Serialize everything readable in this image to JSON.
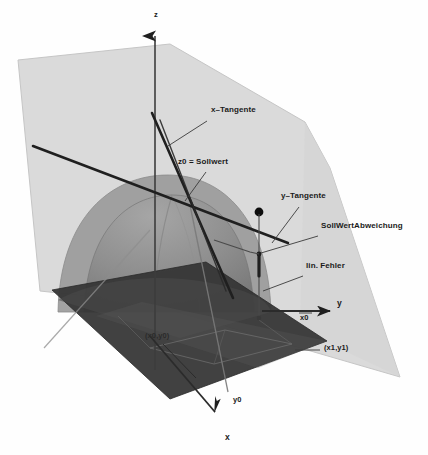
{
  "axes": {
    "z": {
      "label": "z",
      "x": 154,
      "y": 13
    },
    "y": {
      "label": "y",
      "x": 337,
      "y": 303
    },
    "x": {
      "label": "x",
      "x": 225,
      "y": 437
    }
  },
  "annotations": {
    "x_tangente": {
      "label": "x–Tangente",
      "x": 211,
      "y": 110
    },
    "z0_sollwert": {
      "label": "z0 = Sollwert",
      "x": 180,
      "y": 162
    },
    "y_tangente": {
      "label": "y–Tangente",
      "x": 281,
      "y": 196
    },
    "sollwertabweichung": {
      "label": "SollWertAbweichung",
      "x": 322,
      "y": 226
    },
    "lin_fehler": {
      "label": "lin. Fehler",
      "x": 307,
      "y": 266
    },
    "x0": {
      "label": "x0",
      "x": 301,
      "y": 317
    },
    "y0": {
      "label": "y0",
      "x": 234,
      "y": 400
    },
    "point_x0y0": {
      "label": "(x0,y0)",
      "x": 148,
      "y": 337
    },
    "point_x1y1": {
      "label": "(x1,y1)",
      "x": 325,
      "y": 348
    }
  },
  "colors": {
    "background": "#fefefe",
    "light_plane": "#d9d9d9",
    "light_plane_stroke": "#c2c2c2",
    "dark_plane": "#343434",
    "dome_outer": "#9a9a9a",
    "dome_inner": "#7e7e7e",
    "dome_core": "#6e6e6e",
    "axis_line": "#2b2b2b",
    "tangent_line": "#1f1f1f",
    "thin_line": "#555555",
    "leader_line": "#3a3a3a",
    "marker_dot": "#0d0d0d",
    "text": "#1a1a1a"
  },
  "geometry": {
    "light_plane_points": "18,60 170,44 305,122 330,168 400,377 142,302 40,291",
    "dark_plane_points": "52,290 206,262 327,341 170,399",
    "dome_outer_path": "M 58,312 C 60,218 112,176 168,176 C 224,176 268,220 270,312 Z",
    "dome_inner_path": "M 85,312 C 88,232 128,196 172,196 C 216,196 250,234 252,312 Z",
    "tangent_cross": {
      "x": 190,
      "y": 205
    },
    "marker_dot": {
      "x": 259,
      "y": 212,
      "r": 4.5
    }
  },
  "legend_items": [
    "x–Tangente",
    "z0 = Sollwert",
    "y–Tangente",
    "SollWertAbweichung",
    "lin. Fehler"
  ]
}
